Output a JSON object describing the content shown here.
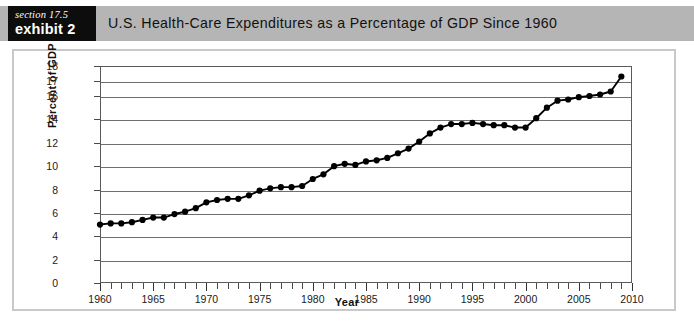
{
  "exhibit": {
    "section_label": "section 17.5",
    "exhibit_label": "exhibit 2",
    "title": "U.S. Health-Care Expenditures as a Percentage of GDP Since 1960"
  },
  "colors": {
    "header_band": "#b5b5b5",
    "badge_background": "#0d0d0d",
    "badge_text": "#ffffff",
    "frame_border": "#c9c9c9",
    "axis": "#5a5a5a",
    "gridline": "#6f6f6f",
    "series": "#000000",
    "plot_background": "#ffffff"
  },
  "chart_data": {
    "type": "line",
    "title": "U.S. Health-Care Expenditures as a Percentage of GDP Since 1960",
    "xlabel": "Year",
    "ylabel": "Percent of GDP",
    "xlim": [
      1960,
      2010
    ],
    "ylim": [
      0,
      18
    ],
    "grid": true,
    "legend": null,
    "markers": true,
    "x_tick_labels": [
      "1960",
      "1965",
      "1970",
      "1975",
      "1980",
      "1985",
      "1990",
      "1995",
      "2000",
      "2005",
      "2010"
    ],
    "x_tick_values": [
      1960,
      1965,
      1970,
      1975,
      1980,
      1985,
      1990,
      1995,
      2000,
      2005,
      2010
    ],
    "x_minor_tick_interval": 1,
    "y_tick_labels": [
      "0",
      "2",
      "4",
      "6",
      "8",
      "10",
      "12",
      "14",
      "16",
      "17",
      "18"
    ],
    "y_tick_values": [
      0,
      2,
      4,
      6,
      8,
      10,
      12,
      14,
      16,
      17,
      18
    ],
    "series": [
      {
        "name": "U.S. Health-Care Expenditures as a Percentage of GDP",
        "x": [
          1960,
          1961,
          1962,
          1963,
          1964,
          1965,
          1966,
          1967,
          1968,
          1969,
          1970,
          1971,
          1972,
          1973,
          1974,
          1975,
          1976,
          1977,
          1978,
          1979,
          1980,
          1981,
          1982,
          1983,
          1984,
          1985,
          1986,
          1987,
          1988,
          1989,
          1990,
          1991,
          1992,
          1993,
          1994,
          1995,
          1996,
          1997,
          1998,
          1999,
          2000,
          2001,
          2002,
          2003,
          2004,
          2005,
          2006,
          2007,
          2008,
          2009
        ],
        "values": [
          5.0,
          5.1,
          5.1,
          5.2,
          5.4,
          5.6,
          5.6,
          5.9,
          6.1,
          6.4,
          6.9,
          7.1,
          7.2,
          7.2,
          7.5,
          7.9,
          8.1,
          8.2,
          8.2,
          8.3,
          8.9,
          9.3,
          10.0,
          10.2,
          10.1,
          10.4,
          10.5,
          10.7,
          11.1,
          11.5,
          12.1,
          12.8,
          13.3,
          13.6,
          13.6,
          13.7,
          13.6,
          13.5,
          13.5,
          13.3,
          13.3,
          14.1,
          15.0,
          15.6,
          15.7,
          15.9,
          16.0,
          16.1,
          16.3,
          17.3
        ]
      }
    ]
  }
}
